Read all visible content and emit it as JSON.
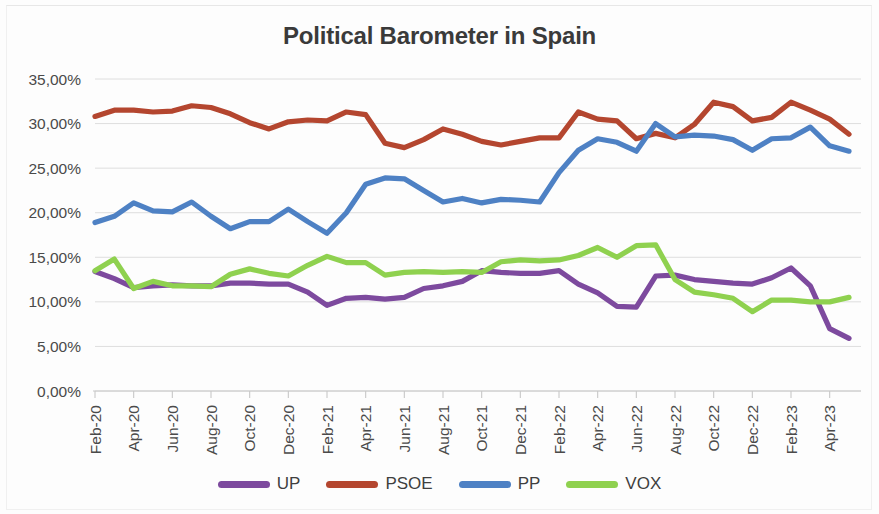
{
  "chart_data": {
    "type": "line",
    "title": "Political Barometer in Spain",
    "xlabel": "",
    "ylabel": "",
    "ylim": [
      0,
      35
    ],
    "ytick_labels": [
      "0,00%",
      "5,00%",
      "10,00%",
      "15,00%",
      "20,00%",
      "25,00%",
      "30,00%",
      "35,00%"
    ],
    "ytick_values": [
      0,
      5,
      10,
      15,
      20,
      25,
      30,
      35
    ],
    "grid": true,
    "legend_position": "bottom",
    "categories": [
      "Feb-20",
      "Mar-20",
      "Apr-20",
      "May-20",
      "Jun-20",
      "Jul-20",
      "Aug-20",
      "Sep-20",
      "Oct-20",
      "Nov-20",
      "Dec-20",
      "Jan-21",
      "Feb-21",
      "Mar-21",
      "Apr-21",
      "May-21",
      "Jun-21",
      "Jul-21",
      "Aug-21",
      "Sep-21",
      "Oct-21",
      "Nov-21",
      "Dec-21",
      "Jan-22",
      "Feb-22",
      "Mar-22",
      "Apr-22",
      "May-22",
      "Jun-22",
      "Jul-22",
      "Aug-22",
      "Sep-22",
      "Oct-22",
      "Nov-22",
      "Dec-22",
      "Jan-23",
      "Feb-23",
      "Mar-23",
      "Apr-23",
      "May-23"
    ],
    "xtick_labels": [
      "Feb-20",
      "Apr-20",
      "Jun-20",
      "Aug-20",
      "Oct-20",
      "Dec-20",
      "Feb-21",
      "Apr-21",
      "Jun-21",
      "Aug-21",
      "Oct-21",
      "Dec-21",
      "Feb-22",
      "Apr-22",
      "Jun-22",
      "Aug-22",
      "Oct-22",
      "Dec-22",
      "Feb-23",
      "Apr-23"
    ],
    "series": [
      {
        "name": "UP",
        "color": "#7D4A9E",
        "values": [
          13.4,
          12.6,
          11.6,
          11.8,
          11.9,
          11.8,
          11.8,
          12.1,
          12.1,
          12.0,
          12.0,
          11.1,
          9.6,
          10.4,
          10.5,
          10.3,
          10.5,
          11.5,
          11.8,
          12.3,
          13.5,
          13.3,
          13.2,
          13.2,
          13.5,
          12.0,
          11.0,
          9.5,
          9.4,
          12.9,
          13.0,
          12.5,
          12.3,
          12.1,
          12.0,
          12.7,
          13.8,
          11.8,
          7.0,
          5.9
        ]
      },
      {
        "name": "PSOE",
        "color": "#B4462F",
        "values": [
          30.8,
          31.5,
          31.5,
          31.3,
          31.4,
          32.0,
          31.8,
          31.1,
          30.1,
          29.4,
          30.2,
          30.4,
          30.3,
          31.3,
          31.0,
          27.8,
          27.3,
          28.2,
          29.4,
          28.8,
          28.0,
          27.6,
          28.0,
          28.4,
          28.4,
          31.3,
          30.5,
          30.3,
          28.3,
          28.9,
          28.4,
          29.9,
          32.4,
          31.9,
          30.3,
          30.7,
          32.4,
          31.5,
          30.5,
          28.8
        ]
      },
      {
        "name": "PP",
        "color": "#4E81C4",
        "values": [
          18.9,
          19.6,
          21.1,
          20.2,
          20.1,
          21.2,
          19.6,
          18.2,
          19.0,
          19.0,
          20.4,
          19.0,
          17.7,
          20.0,
          23.2,
          23.9,
          23.8,
          22.5,
          21.2,
          21.6,
          21.1,
          21.5,
          21.4,
          21.2,
          24.5,
          27.0,
          28.3,
          27.9,
          26.9,
          30.0,
          28.5,
          28.7,
          28.6,
          28.2,
          27.0,
          28.3,
          28.4,
          29.6,
          27.5,
          26.9
        ]
      },
      {
        "name": "VOX",
        "color": "#8FD14F",
        "values": [
          13.5,
          14.8,
          11.5,
          12.3,
          11.8,
          11.8,
          11.7,
          13.1,
          13.7,
          13.2,
          12.9,
          14.1,
          15.1,
          14.4,
          14.4,
          13.0,
          13.3,
          13.4,
          13.3,
          13.4,
          13.3,
          14.5,
          14.7,
          14.6,
          14.7,
          15.2,
          16.1,
          15.0,
          16.3,
          16.4,
          12.5,
          11.1,
          10.8,
          10.4,
          8.9,
          10.2,
          10.2,
          10.0,
          10.0,
          10.5
        ]
      }
    ]
  },
  "legend": {
    "items": [
      {
        "label": "UP",
        "color": "#7D4A9E"
      },
      {
        "label": "PSOE",
        "color": "#B4462F"
      },
      {
        "label": "PP",
        "color": "#4E81C4"
      },
      {
        "label": "VOX",
        "color": "#8FD14F"
      }
    ]
  }
}
